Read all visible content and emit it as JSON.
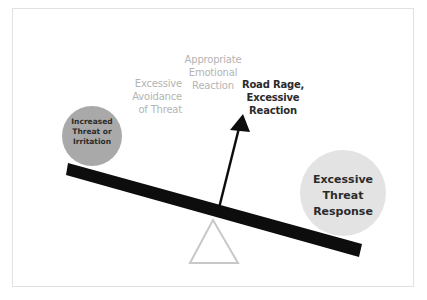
{
  "diagram": {
    "labels": {
      "appropriate": [
        "Appropriate",
        "Emotional",
        "Reaction"
      ],
      "avoidance": [
        "Excessive",
        "Avoidance",
        "of Threat"
      ],
      "road_rage": [
        "Road Rage,",
        "Excessive",
        "Reaction"
      ]
    },
    "left_weight": {
      "lines": [
        "Increased",
        "Threat or",
        "Irritation"
      ],
      "color": "#a9a9a9"
    },
    "right_weight": {
      "lines": [
        "Excessive",
        "Threat",
        "Response"
      ],
      "color": "#e3e3e3"
    },
    "beam_color": "#0d0d0d",
    "fulcrum_color": "#c8c8c8",
    "arrow_color": "#0d0d0d"
  }
}
